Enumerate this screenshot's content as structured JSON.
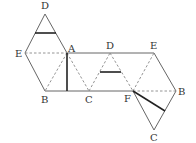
{
  "diagram": {
    "labels": {
      "D_top": "D",
      "E_left": "E",
      "A": "A",
      "B_left": "B",
      "C_mid": "C",
      "D_mid": "D",
      "E_right": "E",
      "F": "F",
      "B_right": "B",
      "C_bottom": "C"
    },
    "colors": {
      "line": "#666666",
      "thick": "#222222",
      "dashed": "#888888"
    }
  }
}
